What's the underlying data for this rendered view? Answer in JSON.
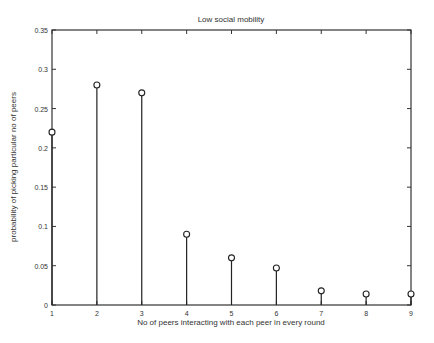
{
  "chart_data": {
    "type": "stem",
    "title": "Low social mobility",
    "xlabel": "No of peers interacting with each peer in every round",
    "ylabel": "probability of picking particular no of peers",
    "x": [
      1,
      2,
      3,
      4,
      5,
      6,
      7,
      8,
      9
    ],
    "values": [
      0.22,
      0.28,
      0.27,
      0.09,
      0.06,
      0.047,
      0.018,
      0.014,
      0.014
    ],
    "xlim": [
      1,
      9
    ],
    "ylim": [
      0,
      0.35
    ],
    "xticks": [
      "1",
      "2",
      "3",
      "4",
      "5",
      "6",
      "7",
      "8",
      "9"
    ],
    "yticks": [
      "0",
      "0.05",
      "0.1",
      "0.15",
      "0.2",
      "0.25",
      "0.3",
      "0.35"
    ],
    "grid": false,
    "legend": null,
    "colors": {
      "stem": "#222222",
      "axes": "#333333"
    }
  }
}
